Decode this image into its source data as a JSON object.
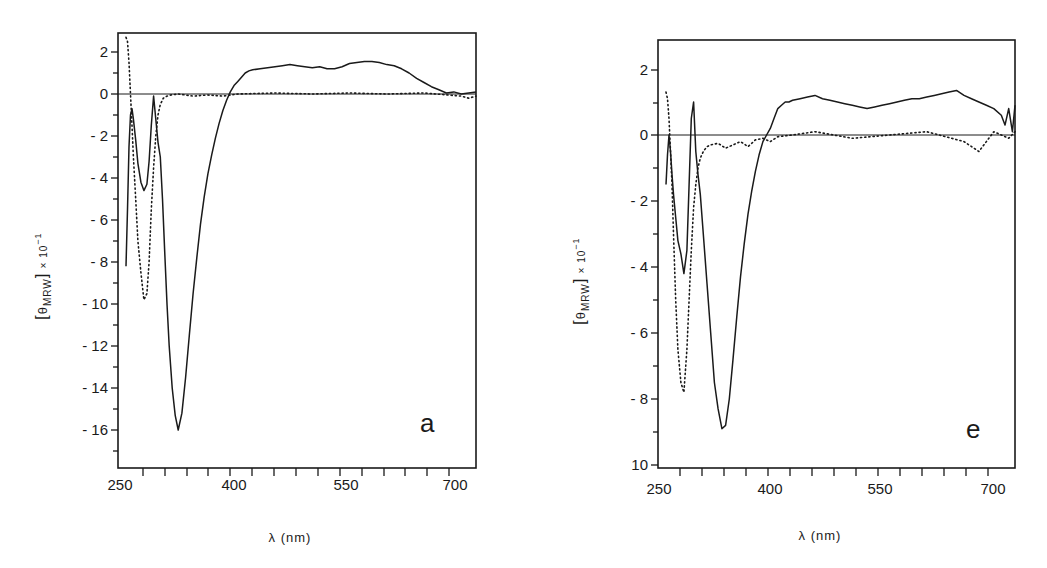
{
  "chart_data": [
    {
      "type": "line",
      "panel_label": "a",
      "xlabel": "λ (nm)",
      "ylabel": "[θMRW] × 10⁻¹",
      "xlim": [
        250,
        720
      ],
      "ylim": [
        -17.7,
        3.0
      ],
      "x_tick_labels": [
        "250",
        "400",
        "550",
        "700"
      ],
      "y_tick_labels": [
        "2",
        "0",
        "-2",
        "-4",
        "-6",
        "-8",
        "-10",
        "-12",
        "-14",
        "-16"
      ],
      "grid": false,
      "zero_line": true,
      "series": [
        {
          "name": "solid",
          "style": "solid",
          "x": [
            250,
            252,
            254,
            256,
            258,
            260,
            263,
            266,
            270,
            274,
            278,
            281,
            284,
            287,
            290,
            293,
            296,
            299,
            302,
            305,
            308,
            312,
            316,
            320,
            325,
            330,
            335,
            340,
            345,
            350,
            355,
            360,
            365,
            370,
            375,
            380,
            385,
            390,
            395,
            400,
            405,
            410,
            415,
            420,
            430,
            440,
            450,
            460,
            470,
            480,
            490,
            500,
            510,
            520,
            530,
            540,
            550,
            560,
            570,
            580,
            590,
            600,
            610,
            620,
            630,
            640,
            650,
            660,
            670,
            680,
            690,
            700,
            710,
            720
          ],
          "y": [
            -8.2,
            -5.5,
            -2.5,
            -1.0,
            -0.7,
            -1.2,
            -2.2,
            -3.3,
            -4.2,
            -4.6,
            -4.3,
            -3.2,
            -1.5,
            -0.1,
            -1.2,
            -2.3,
            -3.0,
            -5.0,
            -7.5,
            -10.0,
            -12.0,
            -14.0,
            -15.3,
            -16.0,
            -15.2,
            -13.5,
            -11.5,
            -9.5,
            -7.8,
            -6.2,
            -4.9,
            -3.8,
            -2.9,
            -2.1,
            -1.4,
            -0.8,
            -0.3,
            0.1,
            0.4,
            0.6,
            0.8,
            1.0,
            1.1,
            1.15,
            1.2,
            1.25,
            1.3,
            1.35,
            1.4,
            1.35,
            1.3,
            1.25,
            1.3,
            1.2,
            1.2,
            1.3,
            1.45,
            1.5,
            1.55,
            1.55,
            1.5,
            1.4,
            1.35,
            1.2,
            1.0,
            0.75,
            0.55,
            0.35,
            0.2,
            0.05,
            0.1,
            0.0,
            0.05,
            0.1
          ]
        },
        {
          "name": "dotted",
          "style": "dotted",
          "x": [
            250,
            252,
            254,
            256,
            258,
            260,
            263,
            266,
            270,
            274,
            278,
            281,
            284,
            287,
            290,
            293,
            296,
            300,
            305,
            310,
            320,
            340,
            360,
            380,
            400,
            450,
            500,
            550,
            600,
            650,
            700,
            710,
            720
          ],
          "y": [
            2.7,
            2.5,
            1.5,
            0.0,
            -1.5,
            -3.0,
            -5.0,
            -7.0,
            -8.5,
            -9.8,
            -9.5,
            -8.0,
            -5.5,
            -3.5,
            -2.0,
            -1.0,
            -0.5,
            -0.2,
            -0.1,
            -0.05,
            0.0,
            -0.1,
            -0.05,
            -0.1,
            0.0,
            0.05,
            0.0,
            0.05,
            0.0,
            0.05,
            -0.1,
            -0.2,
            -0.1
          ]
        }
      ]
    },
    {
      "type": "line",
      "panel_label": "e",
      "xlabel": "λ (nm)",
      "ylabel": "[θMRW] × 10⁻¹",
      "xlim": [
        250,
        720
      ],
      "ylim": [
        -10.0,
        2.9
      ],
      "x_tick_labels": [
        "250",
        "400",
        "550",
        "700"
      ],
      "y_tick_labels": [
        "2",
        "0",
        "-2",
        "-4",
        "-6",
        "-8",
        "10"
      ],
      "grid": false,
      "zero_line": true,
      "series": [
        {
          "name": "solid",
          "style": "solid",
          "x": [
            250,
            252,
            254,
            256,
            258,
            260,
            263,
            266,
            270,
            274,
            278,
            281,
            284,
            287,
            290,
            293,
            296,
            300,
            305,
            310,
            315,
            320,
            325,
            330,
            335,
            340,
            345,
            350,
            355,
            360,
            365,
            370,
            375,
            380,
            385,
            390,
            395,
            400,
            405,
            410,
            415,
            420,
            430,
            440,
            450,
            460,
            470,
            480,
            490,
            500,
            510,
            520,
            530,
            540,
            550,
            560,
            570,
            580,
            590,
            600,
            610,
            620,
            630,
            640,
            650,
            660,
            670,
            680,
            690,
            700,
            705,
            710,
            715,
            720
          ],
          "y": [
            -1.5,
            -0.6,
            0.0,
            -0.5,
            -1.2,
            -1.8,
            -2.5,
            -3.2,
            -3.6,
            -4.2,
            -3.5,
            -1.5,
            0.5,
            1.0,
            -0.5,
            -1.2,
            -1.8,
            -3.0,
            -4.5,
            -6.0,
            -7.5,
            -8.3,
            -8.9,
            -8.8,
            -8.0,
            -6.8,
            -5.5,
            -4.3,
            -3.3,
            -2.4,
            -1.7,
            -1.1,
            -0.6,
            -0.2,
            0.0,
            0.2,
            0.5,
            0.8,
            0.9,
            1.0,
            1.0,
            1.05,
            1.1,
            1.15,
            1.2,
            1.1,
            1.05,
            1.0,
            0.95,
            0.9,
            0.85,
            0.8,
            0.85,
            0.9,
            0.95,
            1.0,
            1.05,
            1.1,
            1.1,
            1.15,
            1.2,
            1.25,
            1.3,
            1.35,
            1.2,
            1.1,
            1.0,
            0.9,
            0.8,
            0.6,
            0.3,
            0.8,
            0.1,
            0.9
          ]
        },
        {
          "name": "dotted",
          "style": "dotted",
          "x": [
            250,
            252,
            254,
            256,
            258,
            260,
            263,
            266,
            270,
            274,
            278,
            281,
            284,
            287,
            290,
            293,
            296,
            300,
            305,
            310,
            320,
            330,
            340,
            350,
            360,
            370,
            380,
            390,
            400,
            420,
            450,
            500,
            550,
            600,
            650,
            670,
            690,
            700,
            710,
            720
          ],
          "y": [
            1.3,
            1.1,
            0.5,
            -0.5,
            -1.5,
            -3.0,
            -5.0,
            -6.5,
            -7.5,
            -7.8,
            -6.5,
            -5.0,
            -3.5,
            -2.2,
            -1.5,
            -1.0,
            -0.7,
            -0.5,
            -0.35,
            -0.3,
            -0.25,
            -0.4,
            -0.3,
            -0.2,
            -0.35,
            -0.15,
            -0.1,
            -0.2,
            -0.05,
            0.0,
            0.1,
            -0.1,
            0.0,
            0.1,
            -0.2,
            -0.5,
            0.1,
            0.0,
            -0.1,
            0.1
          ]
        }
      ]
    }
  ],
  "panels": [
    {
      "id": "a",
      "label": "a",
      "xlabel": "λ  (nm)",
      "ylabel_theta": "θ",
      "ylabel_sub": "MRW",
      "ylabel_factor": "× 10",
      "ylabel_exp": "−1",
      "x_ticks": [
        "250",
        "400",
        "550",
        "700"
      ],
      "y_ticks": [
        "2",
        "0",
        "- 2",
        "- 4",
        "- 6",
        "- 8",
        "- 10",
        "- 12",
        "- 14",
        "- 16"
      ]
    },
    {
      "id": "e",
      "label": "e",
      "xlabel": "λ  (nm)",
      "ylabel_theta": "θ",
      "ylabel_sub": "MRW",
      "ylabel_factor": "× 10",
      "ylabel_exp": "−1",
      "x_ticks": [
        "250",
        "400",
        "550",
        "700"
      ],
      "y_ticks": [
        "2",
        "0",
        "- 2",
        "- 4",
        "- 6",
        "- 8",
        "10"
      ]
    }
  ]
}
